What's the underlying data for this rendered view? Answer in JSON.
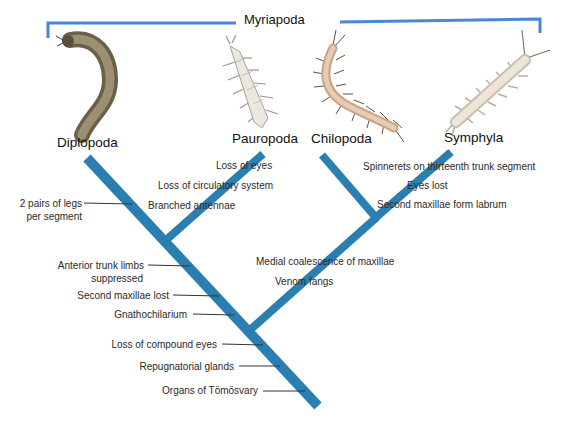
{
  "group": {
    "label": "Myriapoda",
    "bracket_color": "#4a86d4"
  },
  "colors": {
    "branch": "#2a7fb0",
    "leader_line": "#333333",
    "text": "#2a2a2a"
  },
  "taxa": [
    {
      "name": "Diplopoda",
      "illustration": "millipede-icon"
    },
    {
      "name": "Pauropoda",
      "illustration": "pauropod-icon"
    },
    {
      "name": "Chilopoda",
      "illustration": "centipede-icon"
    },
    {
      "name": "Symphyla",
      "illustration": "symphylan-icon"
    }
  ],
  "characters": {
    "diplopoda_branch": [
      "2 pairs of legs",
      "per segment"
    ],
    "pauropoda_branch": [
      "Loss of eyes",
      "Loss of circulatory system",
      "Branched antennae"
    ],
    "symphyla_branch": [
      "Spinnerets on thirteenth trunk segment",
      "Eyes lost",
      "Second maxillae form labrum"
    ],
    "chilopoda_symphyla_clade": [
      "Medial coalescence of maxillae",
      "Venom fangs"
    ],
    "dignatha_clade": [
      "Anterior trunk limbs",
      "suppressed",
      "Second maxillae lost",
      "Gnathochilarium"
    ],
    "myriapoda_root": [
      "Loss of compound eyes",
      "Repugnatorial glands",
      "Organs of Tömösvary"
    ]
  }
}
